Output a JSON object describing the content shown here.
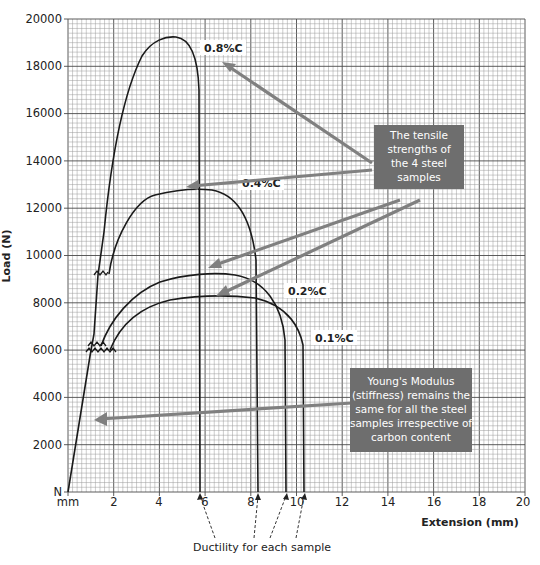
{
  "chart_data": {
    "type": "line",
    "title": "",
    "xlabel": "Extension (mm)",
    "ylabel": "Load (N)",
    "xlim": [
      0,
      20
    ],
    "ylim": [
      0,
      20000
    ],
    "x_ticks": [
      "mm",
      "2",
      "4",
      "6",
      "8",
      "10",
      "12",
      "14",
      "16",
      "18",
      "20"
    ],
    "y_ticks": [
      "N",
      "2000",
      "4000",
      "6000",
      "8000",
      "10000",
      "12000",
      "14000",
      "16000",
      "18000",
      "20000"
    ],
    "grid": true,
    "series": [
      {
        "name": "0.8%C",
        "tensile_strength": 18000,
        "fracture_extension": 6.0,
        "yield_point": 9200
      },
      {
        "name": "0.4%C",
        "tensile_strength": 12600,
        "fracture_extension": 8.3,
        "yield_point": 6200
      },
      {
        "name": "0.2%C",
        "tensile_strength": 9200,
        "fracture_extension": 9.6,
        "yield_point": 6100
      },
      {
        "name": "0.1%C",
        "tensile_strength": 8200,
        "fracture_extension": 10.4,
        "yield_point": 6000
      }
    ],
    "annotations": [
      "The tensile strengths of the 4 steel samples",
      "Young's Modulus (stiffness) remains the same for all the steel samples irrespective of carbon content",
      "Ductility for each sample"
    ]
  },
  "labels": {
    "x_axis_title": "Extension (mm)",
    "y_axis_title": "Load (N)",
    "x_origin_unit": "mm",
    "y_origin_unit": "N",
    "x_ticks": [
      "2",
      "4",
      "6",
      "8",
      "10",
      "12",
      "14",
      "16",
      "18",
      "20"
    ],
    "y_ticks": [
      "2000",
      "4000",
      "6000",
      "8000",
      "10000",
      "12000",
      "14000",
      "16000",
      "18000",
      "20000"
    ],
    "curve_08": "0.8%C",
    "curve_04": "0.4%C",
    "curve_02": "0.2%C",
    "curve_01": "0.1%C",
    "tensile_note": [
      "The tensile",
      "strengths of",
      "the 4 steel",
      "samples"
    ],
    "modulus_note": [
      "Young's Modulus",
      "(stiffness) remains the",
      "same for all the steel",
      "samples irrespective of",
      "carbon content"
    ],
    "ductility_caption": "Ductility for each sample"
  },
  "colors": {
    "grid_minor": "#9a9a9a",
    "grid_major": "#4a4a4a",
    "curve": "#1a1a1a",
    "annotation_box": "#6e6e6e",
    "annotation_arrow": "#808080"
  }
}
